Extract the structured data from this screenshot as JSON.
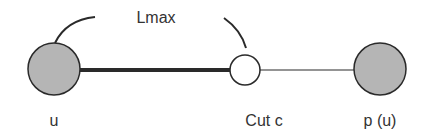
{
  "diagram": {
    "title": "Lmax",
    "nodes": [
      {
        "id": "u",
        "label": "u",
        "type": "filled"
      },
      {
        "id": "c",
        "label": "Cut c",
        "type": "hollow"
      },
      {
        "id": "pu",
        "label": "p (u)",
        "type": "filled"
      }
    ],
    "edges": [
      {
        "from": "u",
        "to": "c",
        "style": "thick"
      },
      {
        "from": "c",
        "to": "pu",
        "style": "thin"
      }
    ],
    "span_label": "Lmax",
    "colors": {
      "node_fill": "#b5b5b5",
      "node_stroke": "#2a2a2a",
      "hollow_fill": "#ffffff",
      "edge": "#2a2a2a",
      "text": "#333333"
    }
  }
}
